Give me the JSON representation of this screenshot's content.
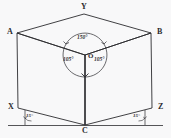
{
  "figure": {
    "kind": "isometric-cube-angle-diagram",
    "background_color": "#f8f8f9",
    "stroke_color": "#2b2b2f",
    "vertices": [
      {
        "id": "A",
        "label": "A",
        "x": 17,
        "y": 33,
        "name": "vertex-label-a"
      },
      {
        "id": "Y",
        "label": "Y",
        "x": 84,
        "y": 14,
        "name": "vertex-label-y"
      },
      {
        "id": "B",
        "label": "B",
        "x": 151,
        "y": 33,
        "name": "vertex-label-b"
      },
      {
        "id": "O",
        "label": "O",
        "x": 85,
        "y": 55,
        "name": "vertex-label-o"
      },
      {
        "id": "X",
        "label": "X",
        "x": 18,
        "y": 108,
        "name": "vertex-label-x"
      },
      {
        "id": "Z",
        "label": "Z",
        "x": 152,
        "y": 108,
        "name": "vertex-label-z"
      },
      {
        "id": "C",
        "label": "C",
        "x": 85,
        "y": 125,
        "name": "vertex-label-c"
      }
    ],
    "angles": [
      {
        "id": "top",
        "label": "150°",
        "name": "angle-label-150-top"
      },
      {
        "id": "left",
        "label": "105°",
        "name": "angle-label-105-left"
      },
      {
        "id": "right",
        "label": "105°",
        "name": "angle-label-105-right"
      },
      {
        "id": "base-left",
        "label": "15°",
        "name": "angle-label-15-left"
      },
      {
        "id": "base-right",
        "label": "15°",
        "name": "angle-label-15-right"
      }
    ]
  }
}
